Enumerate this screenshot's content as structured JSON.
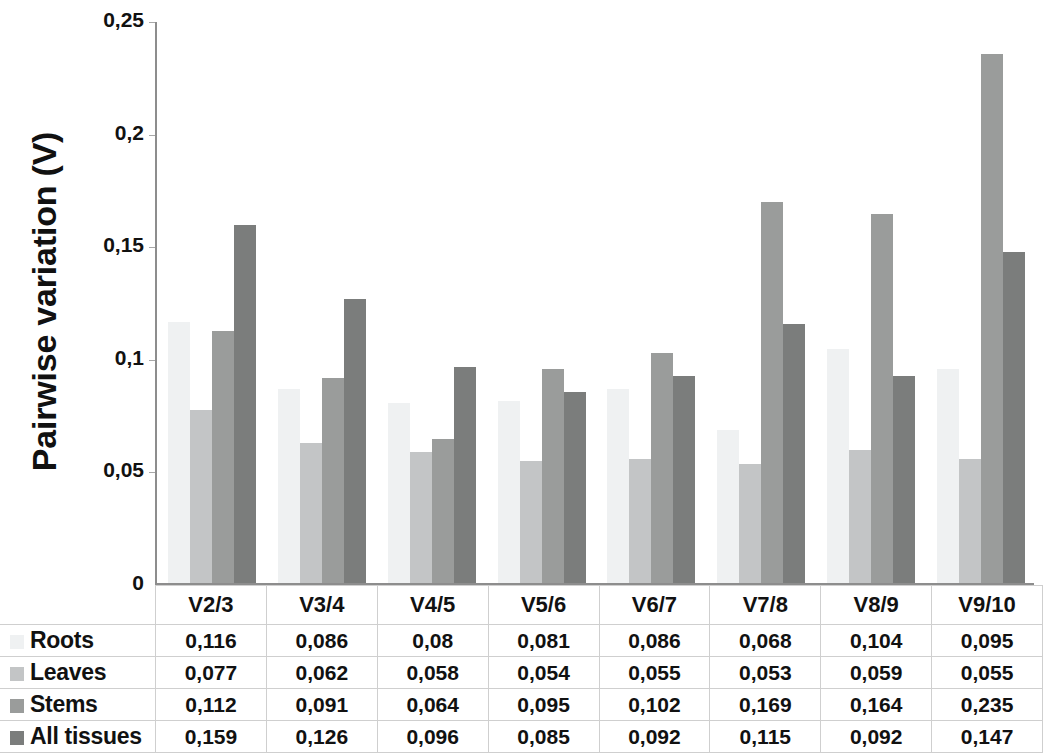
{
  "chart_data": {
    "type": "bar",
    "title": "",
    "xlabel": "",
    "ylabel": "Pairwise variation (V)",
    "categories": [
      "V2/3",
      "V3/4",
      "V4/5",
      "V5/6",
      "V6/7",
      "V7/8",
      "V8/9",
      "V9/10"
    ],
    "series": [
      {
        "name": "Roots",
        "color": "#eff1f2",
        "values": [
          0.116,
          0.086,
          0.08,
          0.081,
          0.086,
          0.068,
          0.104,
          0.095
        ]
      },
      {
        "name": "Leaves",
        "color": "#c3c5c6",
        "values": [
          0.077,
          0.062,
          0.058,
          0.054,
          0.055,
          0.053,
          0.059,
          0.055
        ]
      },
      {
        "name": "Stems",
        "color": "#9a9c9b",
        "values": [
          0.112,
          0.091,
          0.064,
          0.095,
          0.102,
          0.169,
          0.164,
          0.235
        ]
      },
      {
        "name": "All tissues",
        "color": "#7b7d7c",
        "values": [
          0.159,
          0.126,
          0.096,
          0.085,
          0.092,
          0.115,
          0.092,
          0.147
        ]
      }
    ],
    "value_labels": [
      [
        "0,116",
        "0,086",
        "0,08",
        "0,081",
        "0,086",
        "0,068",
        "0,104",
        "0,095"
      ],
      [
        "0,077",
        "0,062",
        "0,058",
        "0,054",
        "0,055",
        "0,053",
        "0,059",
        "0,055"
      ],
      [
        "0,112",
        "0,091",
        "0,064",
        "0,095",
        "0,102",
        "0,169",
        "0,164",
        "0,235"
      ],
      [
        "0,159",
        "0,126",
        "0,096",
        "0,085",
        "0,092",
        "0,115",
        "0,092",
        "0,147"
      ]
    ],
    "ylim": [
      0,
      0.25
    ],
    "yticks": [
      0,
      0.05,
      0.1,
      0.15,
      0.2,
      0.25
    ],
    "ytick_labels": [
      "0",
      "0,05",
      "0,1",
      "0,15",
      "0,2",
      "0,25"
    ],
    "grid": false,
    "legend_position": "data-table-row-headers"
  }
}
